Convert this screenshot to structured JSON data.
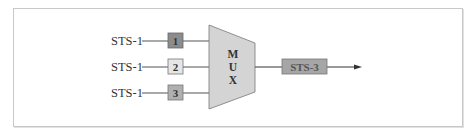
{
  "diagram": {
    "inputs": [
      {
        "label": "STS-1",
        "frame": "1",
        "fill": "#8c8c8c"
      },
      {
        "label": "STS-1",
        "frame": "2",
        "fill": "#e6e6e6"
      },
      {
        "label": "STS-1",
        "frame": "3",
        "fill": "#b0b0b0"
      }
    ],
    "mux": {
      "letters": [
        "M",
        "U",
        "X"
      ],
      "fill": "#d4d4d4"
    },
    "output": {
      "label": "STS-3",
      "fill": "#a6a6a6"
    },
    "colors": {
      "line": "#555555",
      "border": "#c8c8c8"
    }
  }
}
